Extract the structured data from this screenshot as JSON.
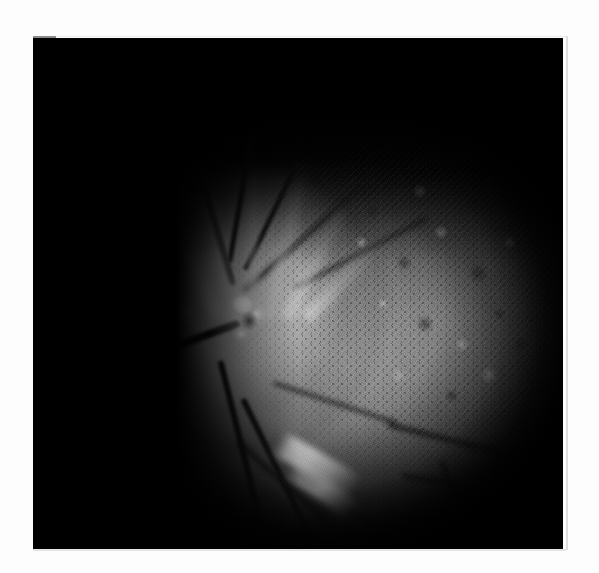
{
  "page": {
    "background_color": "#fdfdfd",
    "width": 599,
    "height": 573
  },
  "figure": {
    "kind": "photograph",
    "modality": "monochrome retinal fundus photograph",
    "caption": "",
    "alt_text": "Grayscale retinal fundus photograph showing a bright optic disc left of centre with radiating nerve fibre streaks, dark branching retinal vessels, a mottled granular region across the temporal retina, and a heavily vignetted black margin.",
    "frame": {
      "left": 33,
      "top": 38,
      "width": 530,
      "height": 511,
      "background_color": "#000000",
      "border_rule_color": "#dedede"
    },
    "corner_tick": {
      "label": "registration-tick",
      "color": "#8a8a8a",
      "left": 33,
      "top": 36,
      "width": 23,
      "height": 3
    },
    "tones": {
      "darkest": "#000000",
      "background_field": "#0d0d0d",
      "mid_retina": "#969696",
      "bright_retina": "#d7d7d7",
      "optic_disc_highlight": "#ffffff",
      "vessel": "#0d0d0d"
    },
    "features": [
      {
        "name": "optic-disc",
        "description": "bright white optic disc with central cup",
        "cx": 211,
        "cy": 274,
        "rx": 43,
        "ry": 46
      },
      {
        "name": "optic-cup-shadow",
        "description": "dark vascular notch within the cup",
        "cx": 216,
        "cy": 283,
        "rx": 10,
        "ry": 11
      },
      {
        "name": "nerve-fibre-spokes",
        "description": "bright radiating streaks fanning superiorly",
        "cx": 215,
        "cy": 270,
        "count": 7
      },
      {
        "name": "mottled-temporal-field",
        "description": "granular stippled retina, laser-scar pattern",
        "cx": 446,
        "cy": 294,
        "rx": 215,
        "ry": 210
      },
      {
        "name": "inferior-bright-band",
        "description": "bright elongated inferior streak",
        "cx": 284,
        "cy": 427,
        "angle_deg": 30
      },
      {
        "name": "vessel-arcade-superior",
        "description": "dark vessel arcade sweeping up and temporal",
        "cx": 300,
        "cy": 200
      },
      {
        "name": "vessel-arcade-inferior",
        "description": "dark vessel arcade sweeping down and temporal",
        "cx": 330,
        "cy": 450
      },
      {
        "name": "nasal-vessel-loop",
        "description": "dark looping vessel along the nasal margin",
        "cx": 140,
        "cy": 355
      },
      {
        "name": "nasal-fleck",
        "description": "small bright fleck in the dark nasal field",
        "cx": 48,
        "cy": 318
      },
      {
        "name": "vignette",
        "description": "black vignette crushing the outer field",
        "cx": 320,
        "cy": 315
      }
    ]
  }
}
